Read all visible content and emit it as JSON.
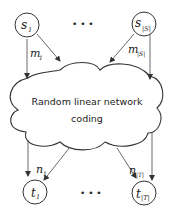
{
  "diagram": {
    "sources": [
      {
        "id": "s1",
        "label": "s",
        "subscript": "1"
      },
      {
        "id": "sS",
        "label": "s",
        "subscript": "|S|"
      }
    ],
    "sinks": [
      {
        "id": "t1",
        "label": "t",
        "subscript": "1"
      },
      {
        "id": "tT",
        "label": "t",
        "subscript": "|T|"
      }
    ],
    "source_edges": [
      {
        "label": "m",
        "subscript": "1"
      },
      {
        "label": "m",
        "subscript": "|S|"
      }
    ],
    "sink_edges": [
      {
        "label": "n",
        "subscript": "1"
      },
      {
        "label": "n",
        "subscript": "|T|"
      }
    ],
    "cloud": {
      "line1": "Random linear network",
      "line2": "coding"
    },
    "ellipsis_top": "• • •",
    "ellipsis_bottom": "• • •"
  }
}
